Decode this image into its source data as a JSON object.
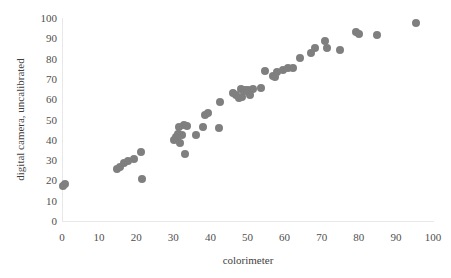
{
  "chart_data": {
    "type": "scatter",
    "title": "",
    "xlabel": "colorimeter",
    "ylabel": "digital camera, uncalibrated",
    "xlim": [
      0,
      100
    ],
    "ylim": [
      0,
      100
    ],
    "xticks": [
      0,
      10,
      20,
      30,
      40,
      50,
      60,
      70,
      80,
      90,
      100
    ],
    "yticks": [
      0,
      10,
      20,
      30,
      40,
      50,
      60,
      70,
      80,
      90,
      100
    ],
    "grid": false,
    "legend": null,
    "series": [
      {
        "name": "measurements",
        "marker": "circle",
        "color": "#7f7f7f",
        "points": [
          [
            0.3,
            17.4
          ],
          [
            0.9,
            18.0
          ],
          [
            14.8,
            25.8
          ],
          [
            15.6,
            26.6
          ],
          [
            16.8,
            28.8
          ],
          [
            17.8,
            29.6
          ],
          [
            19.4,
            30.6
          ],
          [
            21.3,
            34.0
          ],
          [
            21.5,
            20.8
          ],
          [
            30.1,
            39.8
          ],
          [
            30.6,
            41.6
          ],
          [
            31.0,
            40.6
          ],
          [
            31.3,
            43.0
          ],
          [
            31.6,
            46.4
          ],
          [
            31.9,
            38.2
          ],
          [
            32.4,
            42.4
          ],
          [
            32.9,
            47.4
          ],
          [
            33.2,
            33.0
          ],
          [
            33.6,
            46.8
          ],
          [
            36.1,
            42.4
          ],
          [
            38.0,
            46.2
          ],
          [
            38.6,
            52.4
          ],
          [
            39.4,
            53.0
          ],
          [
            42.4,
            45.8
          ],
          [
            42.6,
            58.8
          ],
          [
            46.2,
            63.2
          ],
          [
            47.0,
            62.0
          ],
          [
            47.8,
            60.4
          ],
          [
            48.2,
            65.2
          ],
          [
            48.6,
            61.2
          ],
          [
            49.0,
            64.2
          ],
          [
            49.4,
            64.6
          ],
          [
            49.8,
            63.8
          ],
          [
            50.2,
            64.4
          ],
          [
            50.8,
            62.0
          ],
          [
            51.4,
            65.0
          ],
          [
            53.6,
            65.6
          ],
          [
            54.6,
            73.8
          ],
          [
            56.8,
            71.6
          ],
          [
            57.4,
            70.8
          ],
          [
            58.0,
            73.4
          ],
          [
            59.6,
            74.6
          ],
          [
            60.8,
            75.4
          ],
          [
            62.2,
            75.4
          ],
          [
            64.2,
            80.4
          ],
          [
            67.0,
            82.6
          ],
          [
            68.2,
            85.4
          ],
          [
            70.8,
            88.8
          ],
          [
            71.4,
            85.2
          ],
          [
            75.0,
            84.4
          ],
          [
            79.2,
            93.0
          ],
          [
            80.0,
            92.2
          ],
          [
            84.8,
            91.4
          ],
          [
            95.4,
            97.4
          ]
        ]
      }
    ]
  },
  "axes": {
    "x_tick_labels": [
      "0",
      "10",
      "20",
      "30",
      "40",
      "50",
      "60",
      "70",
      "80",
      "90",
      "100"
    ],
    "y_tick_labels": [
      "0",
      "10",
      "20",
      "30",
      "40",
      "50",
      "60",
      "70",
      "80",
      "90",
      "100"
    ],
    "x_title": "colorimeter",
    "y_title": "digital camera, uncalibrated"
  },
  "colors": {
    "marker": "#7f7f7f",
    "axis": "#e8e8e8",
    "tick_text": "#4f4f4f",
    "title_text": "#3f3f3f",
    "background": "#ffffff"
  }
}
